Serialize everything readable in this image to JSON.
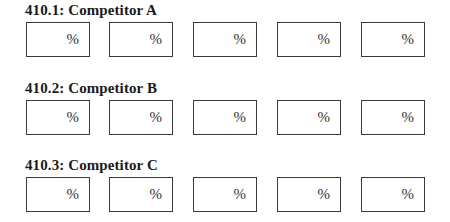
{
  "sections": [
    {
      "title": "410.1: Competitor A",
      "fields": [
        {
          "value": "",
          "unit": "%"
        },
        {
          "value": "",
          "unit": "%"
        },
        {
          "value": "",
          "unit": "%"
        },
        {
          "value": "",
          "unit": "%"
        },
        {
          "value": "",
          "unit": "%"
        }
      ]
    },
    {
      "title": "410.2: Competitor B",
      "fields": [
        {
          "value": "",
          "unit": "%"
        },
        {
          "value": "",
          "unit": "%"
        },
        {
          "value": "",
          "unit": "%"
        },
        {
          "value": "",
          "unit": "%"
        },
        {
          "value": "",
          "unit": "%"
        }
      ]
    },
    {
      "title": "410.3: Competitor C",
      "fields": [
        {
          "value": "",
          "unit": "%"
        },
        {
          "value": "",
          "unit": "%"
        },
        {
          "value": "",
          "unit": "%"
        },
        {
          "value": "",
          "unit": "%"
        },
        {
          "value": "",
          "unit": "%"
        }
      ]
    }
  ]
}
